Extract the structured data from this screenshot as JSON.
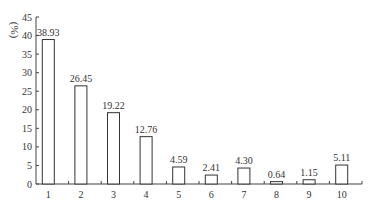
{
  "chart_data": {
    "type": "bar",
    "title": "",
    "xlabel": "",
    "ylabel": "(%)",
    "ylim": [
      0,
      45
    ],
    "yticks": [
      0,
      5,
      10,
      15,
      20,
      25,
      30,
      35,
      40,
      45
    ],
    "categories": [
      "1",
      "2",
      "3",
      "4",
      "5",
      "6",
      "7",
      "8",
      "9",
      "10"
    ],
    "values": [
      38.93,
      26.45,
      19.22,
      12.76,
      4.59,
      2.41,
      4.3,
      0.64,
      1.15,
      5.11
    ],
    "value_labels": [
      "38.93",
      "26.45",
      "19.22",
      "12.76",
      "4.59",
      "2.41",
      "4.30",
      "0.64",
      "1.15",
      "5.11"
    ],
    "grid": false,
    "legend": null,
    "colors": {
      "bar_fill": "#ffffff",
      "bar_stroke": "#333333",
      "axis": "#444444"
    }
  }
}
